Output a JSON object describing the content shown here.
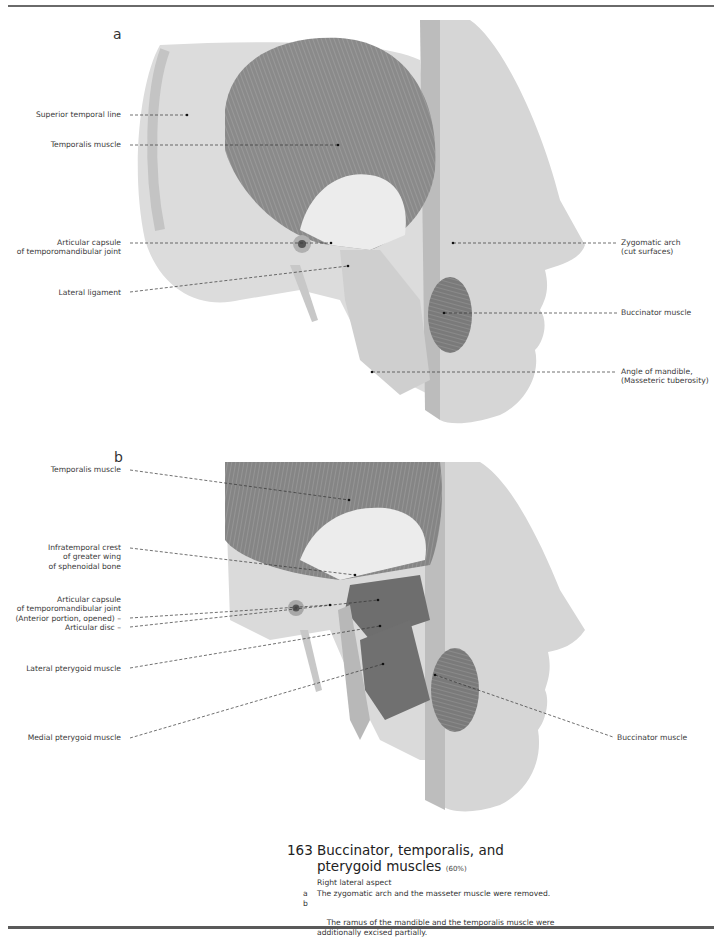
{
  "page": {
    "panels": [
      {
        "letter": "a",
        "labels_left": [
          {
            "text": "Superior temporal line"
          },
          {
            "text": "Temporalis muscle"
          },
          {
            "text": "Articular capsule\nof temporomandibular joint"
          },
          {
            "text": "Lateral ligament"
          }
        ],
        "labels_right": [
          {
            "text": "Zygomatic arch\n(cut surfaces)"
          },
          {
            "text": "Buccinator muscle"
          },
          {
            "text": "Angle of mandible,\n(Masseteric tuberosity)"
          }
        ]
      },
      {
        "letter": "b",
        "labels_left": [
          {
            "text": "Temporalis muscle"
          },
          {
            "text": "Infratemporal crest\nof greater wing\nof sphenoidal bone"
          },
          {
            "text": "Articular capsule\nof temporomandibular joint\n(Anterior portion, opened) –\nArticular disc –"
          },
          {
            "text": "Lateral pterygoid muscle"
          },
          {
            "text": "Medial pterygoid muscle"
          }
        ],
        "labels_right": [
          {
            "text": "Buccinator muscle"
          }
        ]
      }
    ],
    "caption": {
      "number": "163",
      "title_line1": "Buccinator, temporalis, and",
      "title_line2": "pterygoid muscles",
      "scale": "(60%)",
      "subtitle": "Right lateral aspect",
      "items": [
        {
          "key": "a",
          "text": "The zygomatic arch and the masseter muscle were removed."
        },
        {
          "key": "b",
          "text": "The ramus of the mandible and the temporalis muscle were\nadditionally excised partially."
        }
      ]
    }
  }
}
